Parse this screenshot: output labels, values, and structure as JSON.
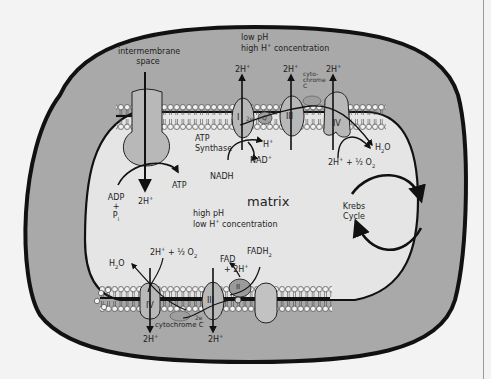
{
  "diagram": {
    "colors": {
      "background": "#f3f3f3",
      "intermembrane_fill": "#a9a9a9",
      "matrix_fill": "#e5e5e5",
      "protein_fill": "#b8b8b8",
      "outline": "#111111"
    },
    "regions": {
      "intermembrane_label_line1": "intermembrane",
      "intermembrane_label_line2": "space",
      "matrix_label": "matrix",
      "outer_condition_line1": "low pH",
      "outer_condition_line2_pre": "high H",
      "outer_condition_line2_sup": "+",
      "outer_condition_line2_post": " concentration",
      "matrix_condition_line1": "high pH",
      "matrix_condition_line2_pre": "low H",
      "matrix_condition_line2_sup": "+",
      "matrix_condition_line2_post": " concentration"
    },
    "top_membrane": {
      "atp_synthase_line1": "ATP",
      "atp_synthase_line2": "Synthase",
      "complex_I": "I",
      "complex_III": "III",
      "complex_IV": "IV",
      "q_label": "Q",
      "two_e": "2e",
      "cytochrome_line1": "cyto-",
      "cytochrome_line2": "chrome",
      "cytochrome_line3": "C",
      "proton_pumped_1": "2H",
      "proton_pumped_2": "2H",
      "proton_pumped_3": "2H",
      "proton_sup": "+",
      "h_plus": "H",
      "nadh": "NADH",
      "nad_plus": "NAD",
      "h2o": "H",
      "h2o_sub": "2",
      "h2o_o": "O",
      "o2_reactant_pre": "2H",
      "o2_reactant_mid": " + ",
      "o2_half": "½",
      "o2": " O",
      "o2_sub": "2",
      "atp": "ATP",
      "adp": "ADP",
      "plus": "+",
      "pi": "P",
      "pi_sub": "i",
      "atp_synthase_proton": "2H"
    },
    "bottom_membrane": {
      "complex_IV": "IV",
      "complex_III": "III",
      "complex_II": "II",
      "cytochrome": "cytochrome C",
      "two_e": "2e",
      "h2o": "H",
      "h2o_sub": "2",
      "h2o_o": "O",
      "o2_reactant_pre": "2H",
      "o2_reactant_mid": " + ",
      "o2_half": "½",
      "o2": " O",
      "o2_sub": "2",
      "fad": "FAD",
      "fad_2h": "+ 2H",
      "fadh2": "FADH",
      "fadh2_sub": "2",
      "proton_out_1": "2H",
      "proton_out_2": "2H"
    },
    "krebs": {
      "line1": "Krebs",
      "line2": "Cycle"
    }
  }
}
